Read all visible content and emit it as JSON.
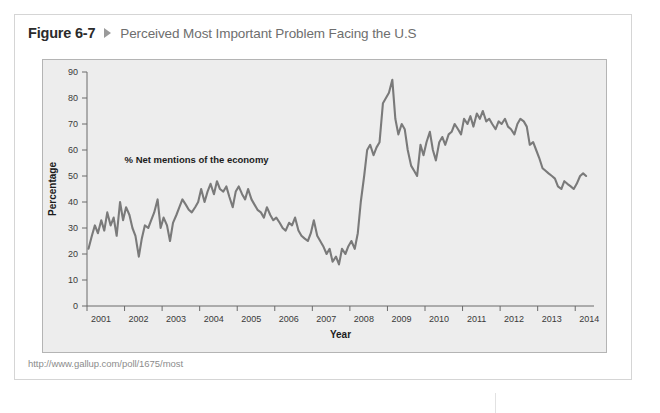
{
  "figure": {
    "number": "Figure 6-7",
    "arrow_icon": "triangle-right-icon",
    "title": "Perceived Most Important Problem Facing the U.S",
    "source_url": "http://www.gallup.com/poll/1675/most"
  },
  "colors": {
    "card_background": "#ffffff",
    "card_border": "#d5d5d5",
    "plot_background": "#ededed",
    "plot_border": "#b4b4b4",
    "line": "#7a7a7a",
    "figure_number_text": "#2b2b2b",
    "title_text": "#6e6e6e",
    "source_text": "#8c8c8c",
    "axis_text": "#3a3a3a"
  },
  "chart_data": {
    "type": "line",
    "title": "Perceived Most Important Problem Facing the U.S",
    "xlabel": "Year",
    "ylabel": "Percentage",
    "ylim": [
      0,
      90
    ],
    "yticks": [
      0,
      10,
      20,
      30,
      40,
      50,
      60,
      70,
      80,
      90
    ],
    "xlim": [
      2001.0,
      2014.5
    ],
    "xticks": [
      2001,
      2002,
      2003,
      2004,
      2005,
      2006,
      2007,
      2008,
      2009,
      2010,
      2011,
      2012,
      2013,
      2014
    ],
    "xtick_labels": [
      "2001",
      "2002",
      "2003",
      "2004",
      "2005",
      "2006",
      "2007",
      "2008",
      "2009",
      "2010",
      "2011",
      "2012",
      "2013",
      "2014"
    ],
    "grid": false,
    "legend": null,
    "annotations": [
      {
        "text": "% Net mentions of the economy",
        "x": 2002.0,
        "y": 55
      }
    ],
    "series": [
      {
        "name": "% Net mentions of the economy",
        "color": "#7a7a7a",
        "x": [
          2001.04,
          2001.13,
          2001.21,
          2001.29,
          2001.38,
          2001.46,
          2001.54,
          2001.63,
          2001.71,
          2001.79,
          2001.88,
          2001.96,
          2002.04,
          2002.13,
          2002.21,
          2002.29,
          2002.38,
          2002.46,
          2002.54,
          2002.63,
          2002.71,
          2002.79,
          2002.88,
          2002.96,
          2003.04,
          2003.13,
          2003.21,
          2003.29,
          2003.38,
          2003.46,
          2003.54,
          2003.63,
          2003.71,
          2003.79,
          2003.88,
          2003.96,
          2004.04,
          2004.13,
          2004.21,
          2004.29,
          2004.38,
          2004.46,
          2004.54,
          2004.63,
          2004.71,
          2004.79,
          2004.88,
          2004.96,
          2005.04,
          2005.13,
          2005.21,
          2005.29,
          2005.38,
          2005.46,
          2005.54,
          2005.63,
          2005.71,
          2005.79,
          2005.88,
          2005.96,
          2006.04,
          2006.13,
          2006.21,
          2006.29,
          2006.38,
          2006.46,
          2006.54,
          2006.63,
          2006.71,
          2006.79,
          2006.88,
          2006.96,
          2007.04,
          2007.13,
          2007.21,
          2007.29,
          2007.38,
          2007.46,
          2007.54,
          2007.63,
          2007.71,
          2007.79,
          2007.88,
          2007.96,
          2008.04,
          2008.13,
          2008.21,
          2008.29,
          2008.38,
          2008.46,
          2008.54,
          2008.63,
          2008.71,
          2008.79,
          2008.88,
          2008.96,
          2009.04,
          2009.13,
          2009.21,
          2009.29,
          2009.38,
          2009.46,
          2009.54,
          2009.63,
          2009.71,
          2009.79,
          2009.88,
          2009.96,
          2010.04,
          2010.13,
          2010.21,
          2010.29,
          2010.38,
          2010.46,
          2010.54,
          2010.63,
          2010.71,
          2010.79,
          2010.88,
          2010.96,
          2011.04,
          2011.13,
          2011.21,
          2011.29,
          2011.38,
          2011.46,
          2011.54,
          2011.63,
          2011.71,
          2011.79,
          2011.88,
          2011.96,
          2012.04,
          2012.13,
          2012.21,
          2012.29,
          2012.38,
          2012.46,
          2012.54,
          2012.63,
          2012.71,
          2012.79,
          2012.88,
          2012.96,
          2013.04,
          2013.13,
          2013.21,
          2013.29,
          2013.38,
          2013.46,
          2013.54,
          2013.63,
          2013.71,
          2013.79,
          2013.88,
          2013.96,
          2014.04,
          2014.13,
          2014.21,
          2014.29
        ],
        "y": [
          22,
          27,
          31,
          28,
          33,
          29,
          36,
          31,
          34,
          27,
          40,
          33,
          38,
          35,
          30,
          27,
          19,
          26,
          31,
          30,
          33,
          36,
          41,
          30,
          34,
          31,
          25,
          32,
          35,
          38,
          41,
          39,
          37,
          36,
          38,
          40,
          45,
          40,
          44,
          47,
          43,
          48,
          45,
          44,
          46,
          42,
          38,
          44,
          46,
          43,
          41,
          45,
          41,
          39,
          37,
          36,
          34,
          38,
          35,
          33,
          34,
          32,
          30,
          29,
          32,
          31,
          34,
          29,
          27,
          26,
          25,
          28,
          33,
          27,
          25,
          23,
          20,
          22,
          17,
          19,
          16,
          22,
          20,
          23,
          25,
          22,
          28,
          40,
          50,
          60,
          62,
          58,
          61,
          63,
          78,
          80,
          82,
          87,
          72,
          66,
          70,
          68,
          60,
          54,
          52,
          50,
          62,
          58,
          63,
          67,
          60,
          56,
          63,
          65,
          62,
          66,
          67,
          70,
          68,
          66,
          72,
          70,
          73,
          69,
          74,
          72,
          75,
          71,
          72,
          70,
          68,
          71,
          70,
          72,
          69,
          68,
          66,
          70,
          72,
          71,
          69,
          62,
          63,
          60,
          57,
          53,
          52,
          51,
          50,
          49,
          46,
          45,
          48,
          47,
          46,
          45,
          47,
          50,
          51,
          50
        ]
      }
    ]
  }
}
